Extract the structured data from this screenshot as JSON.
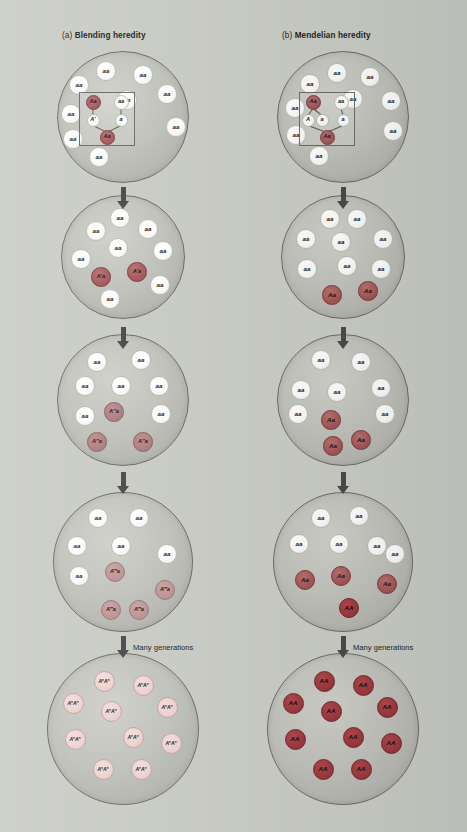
{
  "figure": {
    "background_color": "#c9cbc5",
    "width": 467,
    "height": 832
  },
  "palette": {
    "homozygous_recessive": "#ffffff",
    "heterozygous_dark": "#a65a5b",
    "heterozygous_medium": "#b07f81",
    "heterozygous_light": "#bf9596",
    "blended_pale": "#eed3d0",
    "homozygous_dominant": "#9e3b3f",
    "population_circle": "#bfc1ba",
    "outline": "#6e6a66"
  },
  "panels": [
    {
      "id": "a",
      "prefix": "(a)",
      "title": "Blending heredity",
      "generations": [
        {
          "index": 1,
          "has_inset": true,
          "inset": {
            "parents": [
              {
                "label": "Aa",
                "type": "het1"
              },
              {
                "label": "aa",
                "type": "aa"
              }
            ],
            "gametes": [
              {
                "label": "A'",
                "type": "aa"
              },
              {
                "label": "a",
                "type": "aa"
              }
            ],
            "offspring": {
              "label": "Aa",
              "type": "het1"
            }
          },
          "cells": [
            {
              "label": "aa",
              "type": "aa"
            },
            {
              "label": "aa",
              "type": "aa"
            },
            {
              "label": "aa",
              "type": "aa"
            },
            {
              "label": "aa",
              "type": "aa"
            },
            {
              "label": "aa",
              "type": "aa"
            },
            {
              "label": "aa",
              "type": "aa"
            },
            {
              "label": "aa",
              "type": "aa"
            },
            {
              "label": "aa",
              "type": "aa"
            },
            {
              "label": "aa",
              "type": "aa"
            }
          ]
        },
        {
          "index": 2,
          "has_inset": false,
          "cells": [
            {
              "label": "aa",
              "type": "aa"
            },
            {
              "label": "aa",
              "type": "aa"
            },
            {
              "label": "aa",
              "type": "aa"
            },
            {
              "label": "aa",
              "type": "aa"
            },
            {
              "label": "aa",
              "type": "aa"
            },
            {
              "label": "aa",
              "type": "aa"
            },
            {
              "label": "aa",
              "type": "aa"
            },
            {
              "label": "aa",
              "type": "aa"
            },
            {
              "label": "A'a",
              "type": "het1"
            },
            {
              "label": "A'a",
              "type": "het1"
            }
          ]
        },
        {
          "index": 3,
          "has_inset": false,
          "cells": [
            {
              "label": "aa",
              "type": "aa"
            },
            {
              "label": "aa",
              "type": "aa"
            },
            {
              "label": "aa",
              "type": "aa"
            },
            {
              "label": "aa",
              "type": "aa"
            },
            {
              "label": "aa",
              "type": "aa"
            },
            {
              "label": "aa",
              "type": "aa"
            },
            {
              "label": "aa",
              "type": "aa"
            },
            {
              "label": "A″a",
              "type": "het2"
            },
            {
              "label": "A″a",
              "type": "het2"
            },
            {
              "label": "A″a",
              "type": "het2"
            }
          ]
        },
        {
          "index": 4,
          "has_inset": false,
          "cells": [
            {
              "label": "aa",
              "type": "aa"
            },
            {
              "label": "aa",
              "type": "aa"
            },
            {
              "label": "aa",
              "type": "aa"
            },
            {
              "label": "aa",
              "type": "aa"
            },
            {
              "label": "aa",
              "type": "aa"
            },
            {
              "label": "aa",
              "type": "aa"
            },
            {
              "label": "A‴a",
              "type": "het3"
            },
            {
              "label": "A‴a",
              "type": "het3"
            },
            {
              "label": "A‴a",
              "type": "het3"
            },
            {
              "label": "A‴a",
              "type": "het3"
            }
          ]
        },
        {
          "index": 5,
          "has_inset": false,
          "cells": [
            {
              "label": "AnAn",
              "type": "hom-pale"
            },
            {
              "label": "AnAn",
              "type": "hom-pale"
            },
            {
              "label": "AnAn",
              "type": "hom-pale"
            },
            {
              "label": "AnAn",
              "type": "hom-pale"
            },
            {
              "label": "AnAn",
              "type": "hom-pale"
            },
            {
              "label": "AnAn",
              "type": "hom-pale"
            },
            {
              "label": "AnAn",
              "type": "hom-pale"
            },
            {
              "label": "AnAn",
              "type": "hom-pale"
            },
            {
              "label": "AnAn",
              "type": "hom-pale"
            },
            {
              "label": "AnAn",
              "type": "hom-pale"
            }
          ]
        }
      ],
      "many_generations_label": "Many generations"
    },
    {
      "id": "b",
      "prefix": "(b)",
      "title": "Mendelian heredity",
      "generations": [
        {
          "index": 1,
          "has_inset": true,
          "inset": {
            "parents": [
              {
                "label": "Aa",
                "type": "het1"
              },
              {
                "label": "aa",
                "type": "aa"
              }
            ],
            "gametes": [
              {
                "label": "A",
                "type": "aa"
              },
              {
                "label": "a",
                "type": "aa"
              },
              {
                "label": "a",
                "type": "aa"
              }
            ],
            "offspring": {
              "label": "Aa",
              "type": "het1"
            }
          },
          "cells": [
            {
              "label": "aa",
              "type": "aa"
            },
            {
              "label": "aa",
              "type": "aa"
            },
            {
              "label": "aa",
              "type": "aa"
            },
            {
              "label": "aa",
              "type": "aa"
            },
            {
              "label": "aa",
              "type": "aa"
            },
            {
              "label": "aa",
              "type": "aa"
            },
            {
              "label": "aa",
              "type": "aa"
            },
            {
              "label": "aa",
              "type": "aa"
            },
            {
              "label": "aa",
              "type": "aa"
            }
          ]
        },
        {
          "index": 2,
          "has_inset": false,
          "cells": [
            {
              "label": "aa",
              "type": "aa"
            },
            {
              "label": "aa",
              "type": "aa"
            },
            {
              "label": "aa",
              "type": "aa"
            },
            {
              "label": "aa",
              "type": "aa"
            },
            {
              "label": "aa",
              "type": "aa"
            },
            {
              "label": "aa",
              "type": "aa"
            },
            {
              "label": "aa",
              "type": "aa"
            },
            {
              "label": "aa",
              "type": "aa"
            },
            {
              "label": "Aa",
              "type": "het1"
            },
            {
              "label": "Aa",
              "type": "het1"
            }
          ]
        },
        {
          "index": 3,
          "has_inset": false,
          "cells": [
            {
              "label": "aa",
              "type": "aa"
            },
            {
              "label": "aa",
              "type": "aa"
            },
            {
              "label": "aa",
              "type": "aa"
            },
            {
              "label": "aa",
              "type": "aa"
            },
            {
              "label": "aa",
              "type": "aa"
            },
            {
              "label": "aa",
              "type": "aa"
            },
            {
              "label": "aa",
              "type": "aa"
            },
            {
              "label": "Aa",
              "type": "het1"
            },
            {
              "label": "Aa",
              "type": "het1"
            },
            {
              "label": "Aa",
              "type": "het1"
            }
          ]
        },
        {
          "index": 4,
          "has_inset": false,
          "cells": [
            {
              "label": "aa",
              "type": "aa"
            },
            {
              "label": "aa",
              "type": "aa"
            },
            {
              "label": "aa",
              "type": "aa"
            },
            {
              "label": "aa",
              "type": "aa"
            },
            {
              "label": "aa",
              "type": "aa"
            },
            {
              "label": "aa",
              "type": "aa"
            },
            {
              "label": "Aa",
              "type": "het1"
            },
            {
              "label": "Aa",
              "type": "het1"
            },
            {
              "label": "Aa",
              "type": "het1"
            },
            {
              "label": "AA",
              "type": "hom-dark"
            }
          ]
        },
        {
          "index": 5,
          "has_inset": false,
          "cells": [
            {
              "label": "AA",
              "type": "hom-dark"
            },
            {
              "label": "AA",
              "type": "hom-dark"
            },
            {
              "label": "AA",
              "type": "hom-dark"
            },
            {
              "label": "AA",
              "type": "hom-dark"
            },
            {
              "label": "AA",
              "type": "hom-dark"
            },
            {
              "label": "AA",
              "type": "hom-dark"
            },
            {
              "label": "AA",
              "type": "hom-dark"
            },
            {
              "label": "AA",
              "type": "hom-dark"
            },
            {
              "label": "AA",
              "type": "hom-dark"
            },
            {
              "label": "AA",
              "type": "hom-dark"
            }
          ]
        }
      ],
      "many_generations_label": "Many generations"
    }
  ],
  "layout": {
    "panel_x": [
      123,
      343
    ],
    "title_x": [
      62,
      282
    ],
    "title_y": 34,
    "generation_centers_y": [
      117,
      257,
      400,
      562,
      729
    ],
    "population_radii": [
      66,
      62,
      66,
      70,
      76
    ],
    "arrows_y": [
      187,
      327,
      472,
      636
    ],
    "arrow_heights": [
      22,
      22,
      22,
      22
    ],
    "many_generations_y": 647
  },
  "cell_positions": {
    "gen1_a": [
      [
        -17,
        -46
      ],
      [
        20,
        -42
      ],
      [
        -44,
        -32
      ],
      [
        4,
        -17
      ],
      [
        44,
        -23
      ],
      [
        -52,
        -3
      ],
      [
        53,
        10
      ],
      [
        -50,
        22
      ],
      [
        -24,
        40
      ]
    ],
    "gen1_b": [
      [
        -6,
        -44
      ],
      [
        27,
        -40
      ],
      [
        -33,
        -33
      ],
      [
        10,
        -18
      ],
      [
        48,
        -16
      ],
      [
        -48,
        -9
      ],
      [
        50,
        14
      ],
      [
        -47,
        18
      ],
      [
        -24,
        39
      ]
    ],
    "gen2": [
      [
        -3,
        -39
      ],
      [
        -27,
        -26
      ],
      [
        25,
        -28
      ],
      [
        -5,
        -9
      ],
      [
        40,
        -6
      ],
      [
        -42,
        2
      ],
      [
        37,
        28
      ],
      [
        -13,
        42
      ],
      [
        -22,
        20
      ],
      [
        14,
        15
      ]
    ],
    "gen2_b": [
      [
        -13,
        -38
      ],
      [
        14,
        -38
      ],
      [
        -37,
        -18
      ],
      [
        -2,
        -15
      ],
      [
        40,
        -18
      ],
      [
        -36,
        12
      ],
      [
        38,
        12
      ],
      [
        4,
        9
      ],
      [
        -11,
        38
      ],
      [
        25,
        34
      ]
    ],
    "gen3": [
      [
        -26,
        -38
      ],
      [
        18,
        -40
      ],
      [
        -38,
        -14
      ],
      [
        -2,
        -14
      ],
      [
        36,
        -14
      ],
      [
        -38,
        16
      ],
      [
        38,
        14
      ],
      [
        -26,
        42
      ],
      [
        -9,
        12
      ],
      [
        20,
        42
      ]
    ],
    "gen3_b": [
      [
        -22,
        -40
      ],
      [
        18,
        -38
      ],
      [
        -42,
        -10
      ],
      [
        -6,
        -8
      ],
      [
        38,
        -12
      ],
      [
        -45,
        14
      ],
      [
        42,
        14
      ],
      [
        -12,
        20
      ],
      [
        18,
        40
      ],
      [
        -10,
        46
      ]
    ],
    "gen4": [
      [
        -25,
        -44
      ],
      [
        16,
        -44
      ],
      [
        -46,
        -16
      ],
      [
        -2,
        -16
      ],
      [
        44,
        -8
      ],
      [
        -44,
        14
      ],
      [
        -8,
        10
      ],
      [
        42,
        28
      ],
      [
        -12,
        48
      ],
      [
        16,
        48
      ]
    ],
    "gen4_b": [
      [
        -22,
        -44
      ],
      [
        16,
        -46
      ],
      [
        -44,
        -18
      ],
      [
        -4,
        -18
      ],
      [
        34,
        -16
      ],
      [
        52,
        -8
      ],
      [
        -38,
        18
      ],
      [
        -2,
        14
      ],
      [
        44,
        22
      ],
      [
        6,
        46
      ]
    ],
    "gen5": [
      [
        -19,
        -48
      ],
      [
        20,
        -44
      ],
      [
        -50,
        -26
      ],
      [
        -12,
        -18
      ],
      [
        44,
        -22
      ],
      [
        -48,
        10
      ],
      [
        10,
        8
      ],
      [
        48,
        14
      ],
      [
        -20,
        40
      ],
      [
        18,
        40
      ]
    ]
  }
}
